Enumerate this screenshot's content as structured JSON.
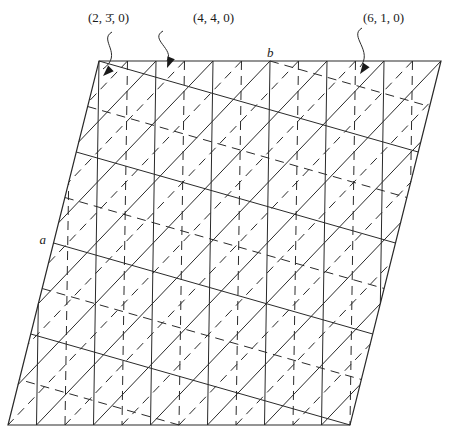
{
  "figure": {
    "type": "crystal-lattice-plane-diagram",
    "axes": {
      "a_label": "a",
      "b_label": "b"
    },
    "cell": {
      "corners": {
        "top_left": [
          99,
          61
        ],
        "top_right": [
          441,
          61
        ],
        "bottom_left": [
          8,
          425
        ],
        "bottom_right": [
          350,
          425
        ]
      }
    },
    "plane_families": [
      {
        "id": "p230",
        "label": "(2, 3̄, 0)",
        "style": "dashed",
        "h": 2,
        "k": -3,
        "l": 0
      },
      {
        "id": "p440",
        "label": "(4, 4, 0)",
        "style": "solid",
        "h": 4,
        "k": 4,
        "l": 0
      },
      {
        "id": "p610",
        "label": "(6, 1, 0)",
        "style": "solid",
        "h": 6,
        "k": 1,
        "l": 0
      }
    ],
    "callouts": [
      {
        "label": "(2, 3̄, 0)",
        "text_pos": [
          88,
          22
        ],
        "arrow_from": [
          112,
          32
        ],
        "arrow_to": [
          103,
          76
        ]
      },
      {
        "label": "(4, 4, 0)",
        "text_pos": [
          193,
          22
        ],
        "arrow_from": [
          163,
          31
        ],
        "arrow_to": [
          167,
          68
        ]
      },
      {
        "label": "(6, 1, 0)",
        "text_pos": [
          363,
          22
        ],
        "arrow_from": [
          362,
          28
        ],
        "arrow_to": [
          360,
          74
        ]
      }
    ],
    "colors": {
      "line": "#2a2a2a",
      "background": "#ffffff",
      "text": "#1a1a1a"
    }
  }
}
